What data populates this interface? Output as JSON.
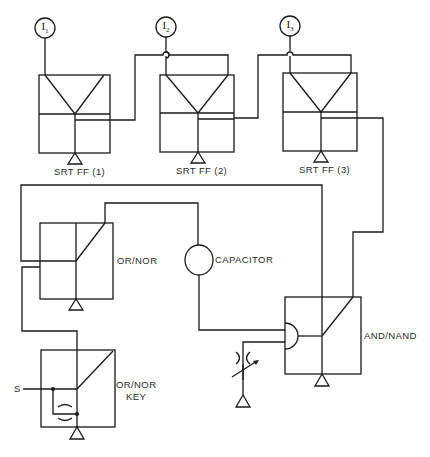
{
  "diagram": {
    "inputs": [
      {
        "id": "I1",
        "label": "I",
        "sub": "1"
      },
      {
        "id": "I2",
        "label": "I",
        "sub": "2"
      },
      {
        "id": "I3",
        "label": "I",
        "sub": "3"
      }
    ],
    "blocks": {
      "ff1": "SRT FF (1)",
      "ff2": "SRT FF (2)",
      "ff3": "SRT FF (3)",
      "or_nor": "OR/NOR",
      "capacitor": "CAPACITOR",
      "and_nand": "AND/NAND",
      "or_nor_key_line1": "OR/NOR",
      "or_nor_key_line2": "KEY"
    },
    "signal_label": "S",
    "colors": {
      "line": "#1a1a1a",
      "background": "#ffffff",
      "text": "#2a2a2a"
    }
  }
}
